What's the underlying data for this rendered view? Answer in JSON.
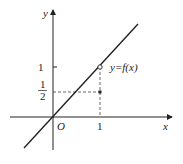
{
  "diagram": {
    "axes": {
      "x_label": "x",
      "y_label": "y",
      "origin_label": "O"
    },
    "ticks": {
      "x_one": "1",
      "y_one": "1",
      "y_half_num": "1",
      "y_half_den": "2"
    },
    "function_label": "y=f(x)",
    "points": [
      {
        "x": 1,
        "y": 1,
        "style": "open"
      },
      {
        "x": 1,
        "y": 0.5,
        "style": "filled"
      }
    ],
    "line": {
      "slope": 1,
      "intercept": 0
    },
    "colors": {
      "stroke": "#222222"
    }
  }
}
